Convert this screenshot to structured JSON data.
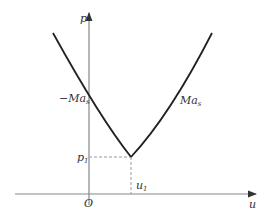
{
  "diagram": {
    "axes": {
      "y_label": "p",
      "x_label": "u",
      "origin_label": "O"
    },
    "curve": {
      "left_branch_label": "−Ma",
      "left_branch_sub": "s",
      "right_branch_label": "Ma",
      "right_branch_sub": "s"
    },
    "minimum_point": {
      "p_label": "p",
      "p_sub": "1",
      "u_label": "u",
      "u_sub": "1"
    },
    "colors": {
      "curve": "#222222",
      "axis": "#888888",
      "dashed": "#999999"
    }
  }
}
